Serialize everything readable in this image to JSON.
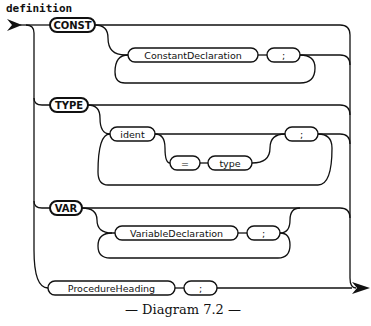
{
  "diagram": {
    "title": "definition",
    "caption": "— Diagram 7.2 —",
    "branches": [
      {
        "keyword": "CONST",
        "loop": [
          "ConstantDeclaration",
          ";"
        ]
      },
      {
        "keyword": "TYPE",
        "loop": [
          "ident",
          "=",
          "type",
          ";"
        ],
        "optional": [
          "=",
          "type"
        ]
      },
      {
        "keyword": "VAR",
        "loop": [
          "VariableDeclaration",
          ";"
        ]
      },
      {
        "sequence": [
          "ProcedureHeading",
          ";"
        ]
      }
    ],
    "labels": {
      "const": "CONST",
      "const_decl": "ConstantDeclaration",
      "const_semi": ";",
      "type": "TYPE",
      "ident": "ident",
      "equals": "=",
      "type_ref": "type",
      "type_semi": ";",
      "var": "VAR",
      "var_decl": "VariableDeclaration",
      "var_semi": ";",
      "proc_heading": "ProcedureHeading",
      "proc_semi": ";"
    }
  }
}
